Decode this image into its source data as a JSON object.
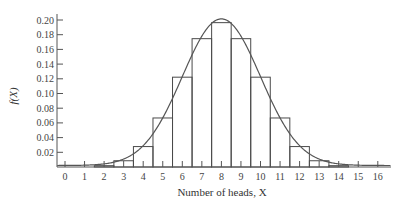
{
  "chart_data": {
    "type": "bar",
    "title": "",
    "xlabel": "Number of heads, X",
    "ylabel": "f(X)",
    "categories": [
      "0",
      "1",
      "2",
      "3",
      "4",
      "5",
      "6",
      "7",
      "8",
      "9",
      "10",
      "11",
      "12",
      "13",
      "14",
      "15",
      "16"
    ],
    "values": [
      2e-05,
      0.0002,
      0.0018,
      0.0085,
      0.0278,
      0.0667,
      0.1222,
      0.1746,
      0.1964,
      0.1746,
      0.1222,
      0.0667,
      0.0278,
      0.0085,
      0.0018,
      0.0002,
      2e-05
    ],
    "overlay": {
      "type": "line",
      "name": "normal approximation curve",
      "mean": 8,
      "sd": 2
    },
    "yticks": [
      "0.02",
      "0.04",
      "0.06",
      "0.08",
      "0.10",
      "0.12",
      "0.14",
      "0.16",
      "0.18",
      "0.20"
    ],
    "xticks": [
      "0",
      "1",
      "2",
      "3",
      "4",
      "5",
      "6",
      "7",
      "8",
      "9",
      "10",
      "11",
      "12",
      "13",
      "14",
      "15",
      "16"
    ],
    "ylim": [
      0,
      0.21
    ],
    "xlim": [
      -0.4,
      16.7
    ],
    "grid": false,
    "legend": null,
    "colors": {
      "bars": "#4a4a4a",
      "curve": "#555555",
      "axis": "#555555"
    }
  }
}
